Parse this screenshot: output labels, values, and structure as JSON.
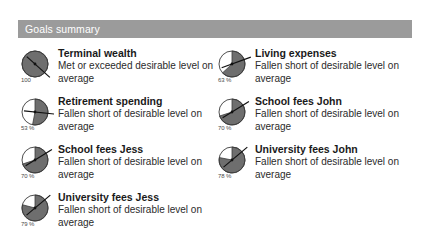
{
  "header": {
    "title": "Goals summary",
    "bar_color": "#9b9b9b",
    "text_color": "#ffffff"
  },
  "palette": {
    "gauge_fill": "#6e6e6e",
    "gauge_stroke": "#3b3b3b",
    "needle": "#111111",
    "text": "#1a1a1a"
  },
  "goals": {
    "left": [
      {
        "title": "Terminal wealth",
        "description": "Met or exceeded desirable level on average",
        "gauge_label": "100",
        "gauge_percent": 100,
        "needle_angle": 132
      },
      {
        "title": "Retirement spending",
        "description": "Fallen short of desirable level on average",
        "gauge_label": "53 %",
        "gauge_percent": 53,
        "needle_angle": 96
      },
      {
        "title": "School fees Jess",
        "description": "Fallen short of desirable level on average",
        "gauge_label": "70 %",
        "gauge_percent": 70,
        "needle_angle": 58
      },
      {
        "title": "University fees Jess",
        "description": "Fallen short of desirable level on average",
        "gauge_label": "79 %",
        "gauge_percent": 79,
        "needle_angle": 50
      }
    ],
    "right": [
      {
        "title": "Living expenses",
        "description": "Fallen short of desirable level on average",
        "gauge_label": "63 %",
        "gauge_percent": 63,
        "needle_angle": 70
      },
      {
        "title": "School fees John",
        "description": "Fallen short of desirable level on average",
        "gauge_label": "70 %",
        "gauge_percent": 70,
        "needle_angle": 58
      },
      {
        "title": "University fees John",
        "description": "Fallen short of desirable level on average",
        "gauge_label": "78 %",
        "gauge_percent": 78,
        "needle_angle": 50
      }
    ]
  }
}
